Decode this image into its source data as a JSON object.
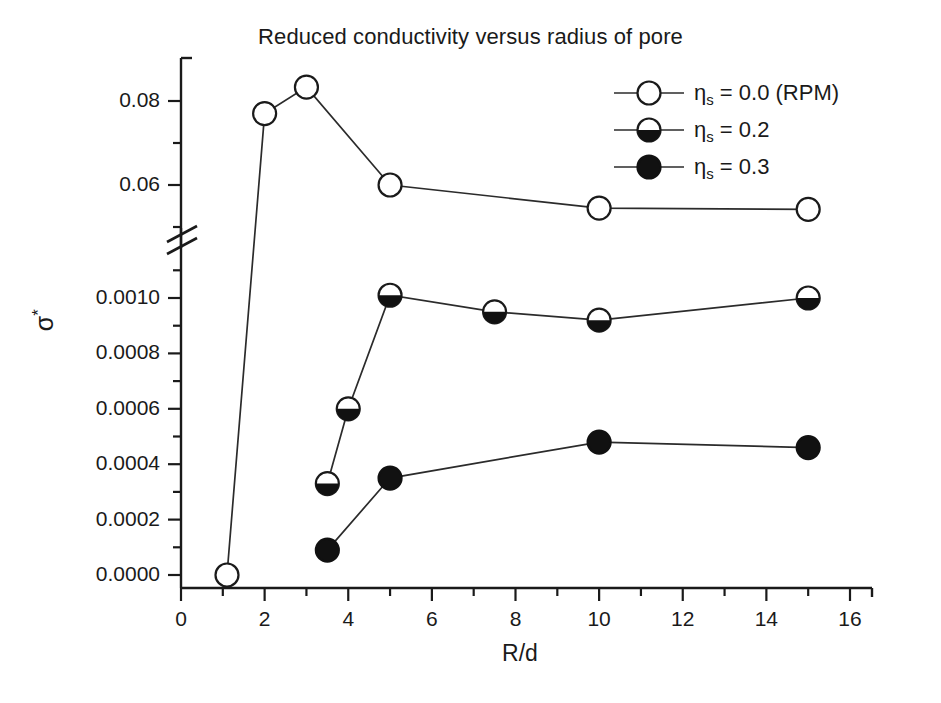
{
  "chart_data": {
    "type": "line",
    "title": "Reduced conductivity versus radius of pore",
    "xlabel": "R/d",
    "ylabel": "σ*",
    "xlim": [
      0,
      16
    ],
    "xticks": [
      0,
      2,
      4,
      6,
      8,
      10,
      12,
      14,
      16
    ],
    "xtick_labels": [
      "0",
      "2",
      "4",
      "6",
      "8",
      "10",
      "12",
      "14",
      "16"
    ],
    "x_minor_ticks": [
      1,
      3,
      5,
      7,
      9,
      11,
      13,
      15
    ],
    "grid": false,
    "broken_axis": true,
    "y_upper_range": [
      0.05,
      0.09
    ],
    "y_lower_range": [
      0.0,
      0.0011
    ],
    "yticks_upper": [
      0.06,
      0.08
    ],
    "ytick_labels_upper": [
      "0.06",
      "0.08"
    ],
    "y_minor_ticks_upper": [
      0.05,
      0.07,
      0.09
    ],
    "yticks_lower": [
      0.0,
      0.0002,
      0.0004,
      0.0006,
      0.0008,
      0.001
    ],
    "ytick_labels_lower": [
      "0.0000",
      "0.0002",
      "0.0004",
      "0.0006",
      "0.0008",
      "0.0010"
    ],
    "y_minor_ticks_lower": [
      0.0001,
      0.0003,
      0.0005,
      0.0007,
      0.0009,
      0.0011
    ],
    "legend_position": "upper right",
    "series": [
      {
        "name": "ηs = 0.0 (RPM)",
        "label_prefix": "η",
        "label_sub": "s",
        "label_suffix": " = 0.0 (RPM)",
        "marker": "open-circle",
        "x": [
          1.1,
          2.0,
          3.0,
          5.0,
          10.0,
          15.0
        ],
        "y": [
          0.0,
          0.077,
          0.0833,
          0.06,
          0.0545,
          0.0542
        ]
      },
      {
        "name": "ηs = 0.2",
        "label_prefix": "η",
        "label_sub": "s",
        "label_suffix": " = 0.2",
        "marker": "half-filled-circle",
        "x": [
          3.5,
          4.0,
          5.0,
          7.5,
          10.0,
          15.0
        ],
        "y": [
          0.00033,
          0.0006,
          0.00101,
          0.00095,
          0.00092,
          0.001
        ]
      },
      {
        "name": "ηs = 0.3",
        "label_prefix": "η",
        "label_sub": "s",
        "label_suffix": " = 0.3",
        "marker": "filled-circle",
        "x": [
          3.5,
          5.0,
          10.0,
          15.0
        ],
        "y": [
          9e-05,
          0.00035,
          0.00048,
          0.00046
        ]
      }
    ],
    "colors": {
      "axis": "#1a1a1a",
      "line": "#2b2b2b",
      "marker_fill_open": "#ffffff",
      "marker_fill_solid": "#111111"
    }
  }
}
